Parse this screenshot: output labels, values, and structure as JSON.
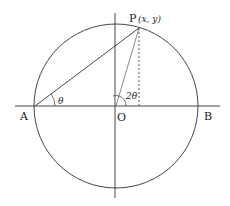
{
  "diagram": {
    "colors": {
      "stroke": "#333333",
      "background": "#ffffff"
    },
    "geometry": {
      "center": [
        116,
        106
      ],
      "radius": 82,
      "A": [
        34,
        106
      ],
      "B": [
        198,
        106
      ],
      "P": [
        139,
        27
      ],
      "foot": [
        139,
        106
      ],
      "h_axis": [
        15,
        106,
        220,
        106
      ],
      "v_axis": [
        115,
        13,
        115,
        198
      ]
    },
    "labels": {
      "A": "A",
      "B": "B",
      "O": "O",
      "P": "P",
      "P_coords": "(x, y)",
      "theta": "θ",
      "two_theta": "2θ"
    }
  }
}
